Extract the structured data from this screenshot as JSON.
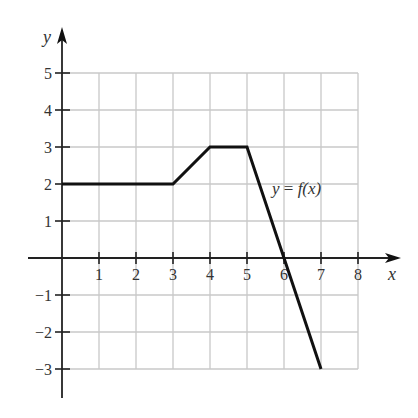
{
  "chart_data": {
    "type": "line",
    "title": "",
    "xlabel": "x",
    "ylabel": "y",
    "xlim": [
      0,
      8
    ],
    "ylim": [
      -3,
      5
    ],
    "grid": true,
    "x_ticks": [
      1,
      2,
      3,
      4,
      5,
      6,
      7,
      8
    ],
    "y_ticks": [
      5,
      4,
      3,
      2,
      1,
      -1,
      -2,
      -3
    ],
    "x_tick_labels": [
      "1",
      "2",
      "3",
      "4",
      "5",
      "6",
      "7",
      "8"
    ],
    "y_tick_labels": [
      "5",
      "4",
      "3",
      "2",
      "1",
      "−1",
      "−2",
      "−3"
    ],
    "series": [
      {
        "name": "y = f(x)",
        "points": [
          [
            0,
            2
          ],
          [
            3,
            2
          ],
          [
            4,
            3
          ],
          [
            5,
            3
          ],
          [
            7,
            -3
          ]
        ]
      }
    ],
    "annotations": [
      {
        "text": "y = f(x)",
        "x": 6.2,
        "y": 2.6
      }
    ],
    "legend": "none"
  },
  "labels": {
    "x_axis": "x",
    "y_axis": "y",
    "function": "y = f(x)",
    "function_y": "y",
    "function_eq": " = ",
    "function_f": "f(x)"
  }
}
